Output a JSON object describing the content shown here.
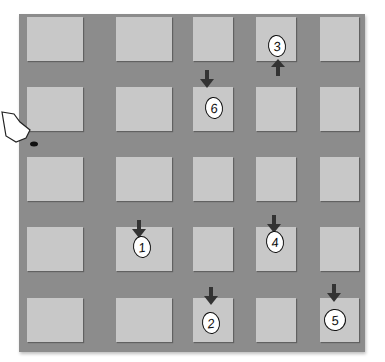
{
  "board": {
    "background_color": "#8c8c8c",
    "square_color": "#c8c8c8",
    "columns_x": [
      27,
      116,
      193,
      256,
      320
    ],
    "rows_y": [
      17,
      87,
      157,
      227,
      298
    ],
    "grid": "5x5"
  },
  "markers": [
    {
      "label": "1",
      "row": 3,
      "col": 1,
      "arrow": "down"
    },
    {
      "label": "2",
      "row": 4,
      "col": 2,
      "arrow": "down"
    },
    {
      "label": "3",
      "row": 0,
      "col": 3,
      "arrow": "up"
    },
    {
      "label": "4",
      "row": 3,
      "col": 3,
      "arrow": "down"
    },
    {
      "label": "5",
      "row": 4,
      "col": 4,
      "arrow": "down"
    },
    {
      "label": "6",
      "row": 1,
      "col": 2,
      "arrow": "down"
    }
  ],
  "cursor": {
    "icon": "pointer-hand-icon"
  }
}
